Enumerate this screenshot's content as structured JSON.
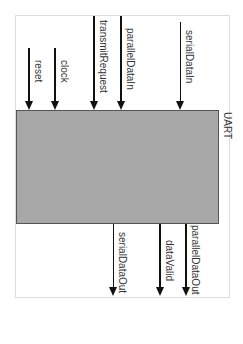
{
  "block": {
    "label": "UART",
    "fill": "#a8a8a8",
    "border": "#555555"
  },
  "inputs": [
    {
      "name": "reset",
      "x": 29,
      "y_start": 48,
      "label_x": 33,
      "label_y": 60
    },
    {
      "name": "clock",
      "x": 55,
      "y_start": 48,
      "label_x": 59,
      "label_y": 60
    },
    {
      "name": "transmitRequest",
      "x": 94,
      "y_start": 16,
      "label_x": 98,
      "label_y": 20
    },
    {
      "name": "parallelDataIn",
      "x": 121,
      "y_start": 16,
      "label_x": 125,
      "label_y": 28
    },
    {
      "name": "serialDataIn",
      "x": 180,
      "y_start": 22,
      "label_x": 184,
      "label_y": 30
    }
  ],
  "outputs": [
    {
      "name": "serialDataOut",
      "x": 113,
      "y_end": 318,
      "label_x": 117,
      "label_y": 232
    },
    {
      "name": "dataValid",
      "x": 159,
      "y_end": 318,
      "label_x": 163,
      "label_y": 240
    },
    {
      "name": "parallelDataOut",
      "x": 185,
      "y_end": 318,
      "label_x": 189,
      "label_y": 225
    }
  ]
}
